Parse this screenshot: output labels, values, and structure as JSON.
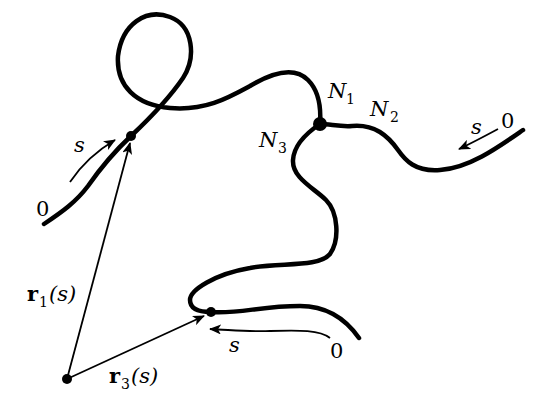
{
  "diagram": {
    "colors": {
      "stroke": "#000000",
      "background": "#ffffff"
    },
    "nodes": {
      "junction_label_1": {
        "base": "N",
        "sub": "1"
      },
      "junction_label_2": {
        "base": "N",
        "sub": "2"
      },
      "junction_label_3": {
        "base": "N",
        "sub": "3"
      }
    },
    "chains": [
      {
        "id": "chain-1",
        "start_label": "0",
        "arc_label": "s"
      },
      {
        "id": "chain-2",
        "start_label": "0",
        "arc_label": "s"
      },
      {
        "id": "chain-3",
        "start_label": "0",
        "arc_label": "s"
      }
    ],
    "vectors": [
      {
        "id": "r1",
        "base": "r",
        "sub": "1",
        "arg": "(s)"
      },
      {
        "id": "r3",
        "base": "r",
        "sub": "3",
        "arg": "(s)"
      }
    ]
  }
}
